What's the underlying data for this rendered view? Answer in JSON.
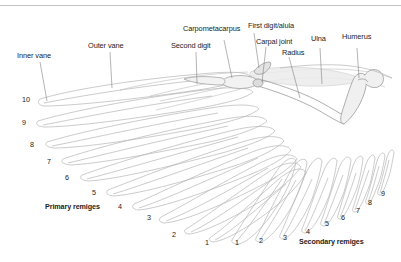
{
  "figure": {
    "background_color": "#ffffff",
    "rule_color": "#c3c3c3",
    "feather_stroke_color": "#b4b4b4",
    "bone_stroke_color": "#a0a0a0",
    "text_color": "#1c1c1c"
  },
  "labels": {
    "inner_vane": "Inner vane",
    "outer_vane": "Outer vane",
    "second_digit": "Second digit",
    "carpometacarpus": "Carpometacarpus",
    "first_digit_alula": "First digit/alula",
    "carpal_joint": "Carpal joint",
    "radius": "Radius",
    "ulna": "Ulna",
    "humerus": "Humerus",
    "primary_remiges": "Primary remiges",
    "secondary_remiges": "Secondary remiges"
  },
  "primary_numbers": [
    "10",
    "9",
    "8",
    "7",
    "6",
    "5",
    "4",
    "3",
    "2",
    "1"
  ],
  "secondary_numbers": [
    "1",
    "2",
    "3",
    "4",
    "5",
    "6",
    "7",
    "8",
    "9"
  ],
  "primary_positions": [
    {
      "n": "10",
      "x": 22,
      "y": 96
    },
    {
      "n": "9",
      "x": 22,
      "y": 119
    },
    {
      "n": "8",
      "x": 30,
      "y": 141
    },
    {
      "n": "7",
      "x": 47,
      "y": 158
    },
    {
      "n": "6",
      "x": 65,
      "y": 174
    },
    {
      "n": "5",
      "x": 92,
      "y": 189
    },
    {
      "n": "4",
      "x": 118,
      "y": 203
    },
    {
      "n": "3",
      "x": 147,
      "y": 214
    },
    {
      "n": "2",
      "x": 172,
      "y": 231
    },
    {
      "n": "1",
      "x": 205,
      "y": 239
    }
  ],
  "secondary_positions": [
    {
      "n": "1",
      "x": 235,
      "y": 239
    },
    {
      "n": "2",
      "x": 259,
      "y": 237
    },
    {
      "n": "3",
      "x": 283,
      "y": 234
    },
    {
      "n": "4",
      "x": 306,
      "y": 228
    },
    {
      "n": "5",
      "x": 325,
      "y": 220
    },
    {
      "n": "6",
      "x": 341,
      "y": 214
    },
    {
      "n": "7",
      "x": 356,
      "y": 207
    },
    {
      "n": "8",
      "x": 368,
      "y": 199
    },
    {
      "n": "9",
      "x": 381,
      "y": 190
    }
  ]
}
